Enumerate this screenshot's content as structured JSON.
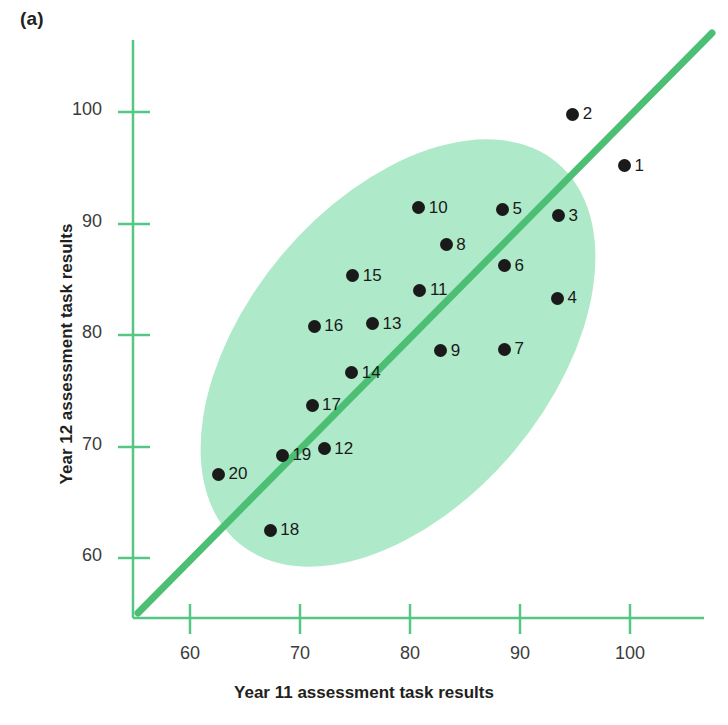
{
  "panel": {
    "label": "(a)"
  },
  "chart_data": {
    "type": "scatter",
    "title": "",
    "xlabel": "Year 11 assessment task results",
    "ylabel": "Year 12 assessment task results",
    "xlim": [
      54.5,
      104
    ],
    "ylim": [
      55.5,
      104.5
    ],
    "xticks": [
      60,
      70,
      80,
      90,
      100
    ],
    "yticks": [
      60,
      70,
      80,
      90,
      100
    ],
    "grid": false,
    "legend": "none",
    "annotations": [
      {
        "kind": "line-of-best-fit",
        "note": "green diagonal y = x trend line",
        "color": "#4dbf75"
      },
      {
        "kind": "ellipse",
        "note": "pale green ellipse enclosing the cluster",
        "color": "#aeeac9"
      }
    ],
    "point_labels": [
      "1",
      "2",
      "3",
      "4",
      "5",
      "6",
      "7",
      "8",
      "9",
      "10",
      "11",
      "12",
      "13",
      "14",
      "15",
      "16",
      "17",
      "18",
      "19",
      "20"
    ],
    "x": [
      99.5,
      94.8,
      93.5,
      93.4,
      88.4,
      88.6,
      88.6,
      83.3,
      82.8,
      80.8,
      80.9,
      72.2,
      76.6,
      74.7,
      74.8,
      71.3,
      71.1,
      67.3,
      68.4,
      62.6
    ],
    "y": [
      95.2,
      99.8,
      90.7,
      83.3,
      91.3,
      86.2,
      78.7,
      88.1,
      78.6,
      91.4,
      84.0,
      69.8,
      81.0,
      76.6,
      85.3,
      80.8,
      73.7,
      62.5,
      69.2,
      67.5
    ],
    "points": [
      {
        "label": "1",
        "x": 99.5,
        "y": 95.2
      },
      {
        "label": "2",
        "x": 94.8,
        "y": 99.8
      },
      {
        "label": "3",
        "x": 93.5,
        "y": 90.7
      },
      {
        "label": "4",
        "x": 93.4,
        "y": 83.3
      },
      {
        "label": "5",
        "x": 88.4,
        "y": 91.3
      },
      {
        "label": "6",
        "x": 88.6,
        "y": 86.2
      },
      {
        "label": "7",
        "x": 88.6,
        "y": 78.7
      },
      {
        "label": "8",
        "x": 83.3,
        "y": 88.1
      },
      {
        "label": "9",
        "x": 82.8,
        "y": 78.6
      },
      {
        "label": "10",
        "x": 80.8,
        "y": 91.4
      },
      {
        "label": "11",
        "x": 80.9,
        "y": 84.0
      },
      {
        "label": "12",
        "x": 72.2,
        "y": 69.8
      },
      {
        "label": "13",
        "x": 76.6,
        "y": 81.0
      },
      {
        "label": "14",
        "x": 74.7,
        "y": 76.6
      },
      {
        "label": "15",
        "x": 74.8,
        "y": 85.3
      },
      {
        "label": "16",
        "x": 71.3,
        "y": 80.8
      },
      {
        "label": "17",
        "x": 71.1,
        "y": 73.7
      },
      {
        "label": "18",
        "x": 67.3,
        "y": 62.5
      },
      {
        "label": "19",
        "x": 68.4,
        "y": 69.2
      },
      {
        "label": "20",
        "x": 62.6,
        "y": 67.5
      }
    ],
    "colors": {
      "marker": "#1a1a1a",
      "axis": "#4dbf75",
      "trend_line": "#4dbf75",
      "ellipse_fill": "#aeeac9",
      "tick_text": "#3b3b3b",
      "title_text": "#231f20"
    }
  }
}
